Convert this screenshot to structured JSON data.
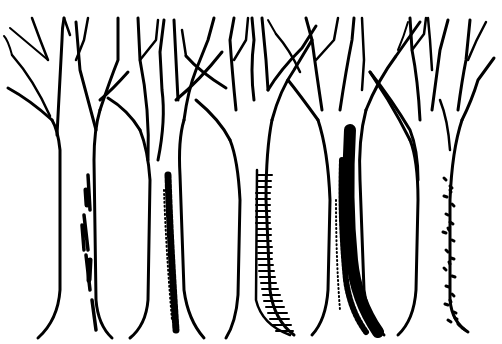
{
  "image": {
    "description": "Black ink illustration of five bare tree trunks with branching crowns, each showing a different bark texture",
    "width": 502,
    "height": 344,
    "colors": {
      "ink": "#000000",
      "paper": "#ffffff"
    },
    "trees": [
      {
        "name": "tree-1",
        "bark": "patchy vertical streaks on right side"
      },
      {
        "name": "tree-2",
        "bark": "stippled dark stripe"
      },
      {
        "name": "tree-3",
        "bark": "horizontal hatching on left side"
      },
      {
        "name": "tree-4",
        "bark": "dense dark shading"
      },
      {
        "name": "tree-5",
        "bark": "scattered dots and dashes"
      }
    ]
  }
}
